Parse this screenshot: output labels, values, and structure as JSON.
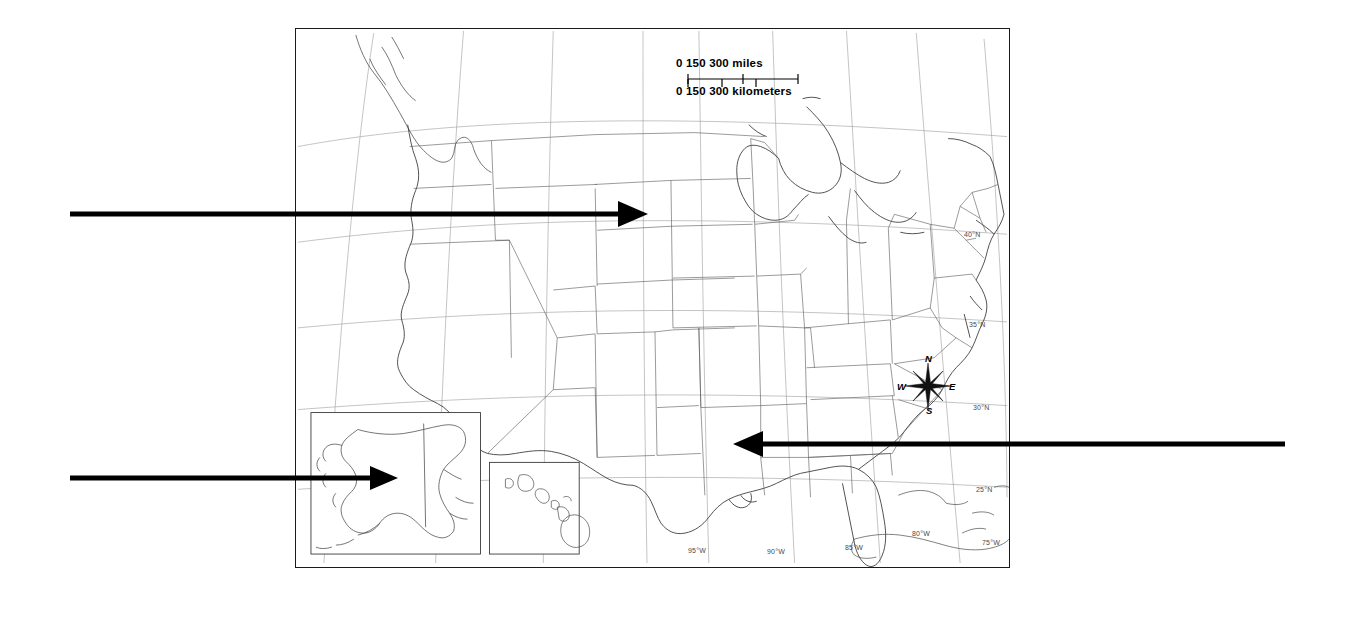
{
  "page": {
    "background_color": "#ffffff",
    "width": 1346,
    "height": 617
  },
  "map": {
    "name": "united-states-base-map",
    "border_color": "#1a1a1a",
    "land_outline_color": "#333333",
    "graticule_color": "#9a9a9a",
    "state_border_color": "#555555",
    "frame": {
      "left": 295,
      "top": 28,
      "width": 715,
      "height": 540
    }
  },
  "scale_bar": {
    "miles": {
      "ticks": [
        "0",
        "150",
        "300"
      ],
      "unit_label": "miles"
    },
    "kilometers": {
      "ticks": [
        "0",
        "150",
        "300"
      ],
      "unit_label": "kilometers"
    },
    "miles_line": "0   150   300 miles",
    "kilometers_line": "0   150   300 kilometers"
  },
  "compass_rose": {
    "north": "N",
    "east": "E",
    "south": "S",
    "west": "W"
  },
  "graticule_labels": {
    "latitude": [
      {
        "label": "40°N",
        "x": 963,
        "y": 232
      },
      {
        "label": "35°N",
        "x": 968,
        "y": 322
      },
      {
        "label": "30°N",
        "x": 972,
        "y": 405
      },
      {
        "label": "25°N",
        "x": 975,
        "y": 487
      }
    ],
    "longitude": [
      {
        "label": "95°W",
        "x": 692,
        "y": 549
      },
      {
        "label": "90°W",
        "x": 771,
        "y": 550
      },
      {
        "label": "85°W",
        "x": 849,
        "y": 546
      },
      {
        "label": "80°W",
        "x": 916,
        "y": 532
      },
      {
        "label": "75°W",
        "x": 986,
        "y": 541
      }
    ]
  },
  "insets": {
    "alaska": {
      "name": "alaska-inset",
      "frame": {
        "left": 310,
        "top": 413,
        "width": 170,
        "height": 142
      }
    },
    "hawaii": {
      "name": "hawaii-inset",
      "frame": {
        "left": 489,
        "top": 463,
        "width": 90,
        "height": 92
      }
    }
  },
  "annotations": {
    "arrow_color": "#000000",
    "arrows": [
      {
        "name": "arrow-upper-midwest",
        "direction": "right",
        "start_x": 70,
        "start_y": 214,
        "end_x": 648,
        "end_y": 214,
        "target": "northern-plains"
      },
      {
        "name": "arrow-alaska-inset",
        "direction": "right",
        "start_x": 70,
        "start_y": 478,
        "end_x": 398,
        "end_y": 478,
        "target": "alaska-inset"
      },
      {
        "name": "arrow-gulf-coast",
        "direction": "left",
        "start_x": 1285,
        "start_y": 444,
        "end_x": 733,
        "end_y": 444,
        "target": "louisiana-gulf-coast"
      }
    ]
  }
}
